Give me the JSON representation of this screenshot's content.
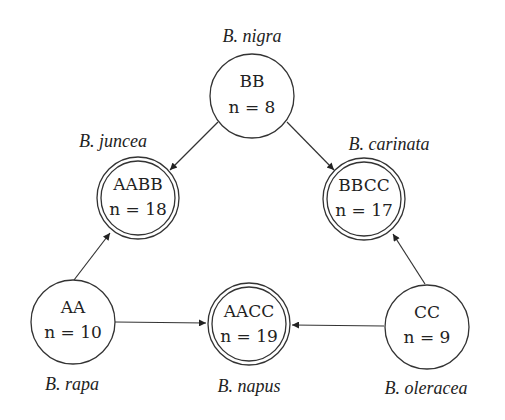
{
  "diagram": {
    "nodes": [
      {
        "id": "BB",
        "genome": "BB",
        "chromosomes": "n = 8",
        "species": "B. nigra",
        "type": "diploid"
      },
      {
        "id": "AABB",
        "genome": "AABB",
        "chromosomes": "n = 18",
        "species": "B. juncea",
        "type": "allotetraploid"
      },
      {
        "id": "BBCC",
        "genome": "BBCC",
        "chromosomes": "n = 17",
        "species": "B. carinata",
        "type": "allotetraploid"
      },
      {
        "id": "AA",
        "genome": "AA",
        "chromosomes": "n = 10",
        "species": "B. rapa",
        "type": "diploid"
      },
      {
        "id": "AACC",
        "genome": "AACC",
        "chromosomes": "n = 19",
        "species": "B. napus",
        "type": "allotetraploid"
      },
      {
        "id": "CC",
        "genome": "CC",
        "chromosomes": "n = 9",
        "species": "B. oleracea",
        "type": "diploid"
      }
    ],
    "edges": [
      {
        "from": "BB",
        "to": "AABB"
      },
      {
        "from": "BB",
        "to": "BBCC"
      },
      {
        "from": "AA",
        "to": "AABB"
      },
      {
        "from": "AA",
        "to": "AACC"
      },
      {
        "from": "CC",
        "to": "AACC"
      },
      {
        "from": "CC",
        "to": "BBCC"
      }
    ],
    "colors": {
      "stroke": "#333333",
      "text": "#222222",
      "background": "#ffffff"
    }
  }
}
